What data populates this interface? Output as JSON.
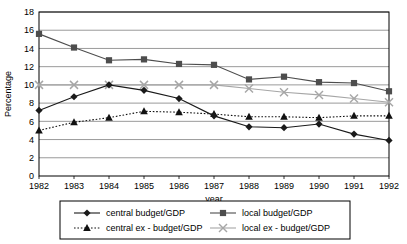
{
  "chart_data": {
    "type": "line",
    "title": "",
    "xlabel": "year",
    "ylabel": "Percentage",
    "categories": [
      "1982",
      "1983",
      "1984",
      "1985",
      "1986",
      "1987",
      "1988",
      "1989",
      "1990",
      "1991",
      "1992"
    ],
    "x": [
      1982,
      1983,
      1984,
      1985,
      1986,
      1987,
      1988,
      1989,
      1990,
      1991,
      1992
    ],
    "xlim": [
      1982,
      1992
    ],
    "ylim": [
      0,
      18
    ],
    "ytick_step": 2,
    "yticks": [
      "0",
      "2",
      "4",
      "6",
      "8",
      "10",
      "12",
      "14",
      "16",
      "18"
    ],
    "grid": "horizontal",
    "legend_position": "bottom",
    "series": [
      {
        "name": "central budget/GDP",
        "marker": "diamond",
        "line_style": "solid",
        "color": "#1a1a1a",
        "values": [
          7.2,
          8.7,
          10.0,
          9.4,
          8.5,
          6.6,
          5.4,
          5.3,
          5.7,
          4.6,
          3.9
        ]
      },
      {
        "name": "local budget/GDP",
        "marker": "square",
        "line_style": "solid",
        "color": "#4d4d4d",
        "values": [
          15.6,
          14.1,
          12.7,
          12.8,
          12.3,
          12.2,
          10.6,
          10.9,
          10.3,
          10.2,
          9.3
        ]
      },
      {
        "name": "central ex - budget/GDP",
        "marker": "triangle",
        "line_style": "dotted",
        "color": "#111111",
        "values": [
          5.0,
          5.9,
          6.4,
          7.1,
          7.0,
          6.8,
          6.5,
          6.5,
          6.4,
          6.6,
          6.6
        ]
      },
      {
        "name": "local ex - budget/GDP",
        "marker": "cross",
        "line_style": "solid",
        "color": "#a6a6a6",
        "values": [
          10.0,
          10.0,
          10.0,
          10.0,
          10.0,
          10.0,
          9.6,
          9.2,
          8.9,
          8.5,
          8.1
        ]
      }
    ],
    "legend": [
      "central budget/GDP",
      "local budget/GDP",
      "central ex - budget/GDP",
      "local ex - budget/GDP"
    ],
    "colors": {
      "plot_border": "#000000",
      "gridline": "#808080",
      "background": "#ffffff",
      "series_central_budget": "#1a1a1a",
      "series_local_budget": "#4d4d4d",
      "series_central_ex_budget": "#111111",
      "series_local_ex_budget": "#a6a6a6"
    }
  }
}
